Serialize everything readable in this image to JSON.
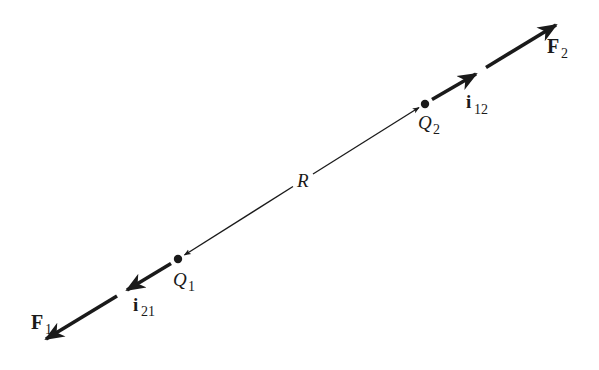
{
  "colors": {
    "ink": "#1a1a1a",
    "background": "#ffffff"
  },
  "charges": [
    {
      "id": "Q1",
      "symbol": "Q",
      "subscript": "1",
      "x": 178,
      "y": 259
    },
    {
      "id": "Q2",
      "symbol": "Q",
      "subscript": "2",
      "x": 425,
      "y": 104
    }
  ],
  "separation": {
    "label": "R"
  },
  "unit_vectors": [
    {
      "id": "i12",
      "symbol": "i",
      "subscript": "12"
    },
    {
      "id": "i21",
      "symbol": "i",
      "subscript": "21"
    }
  ],
  "forces": [
    {
      "id": "F1",
      "symbol": "F",
      "subscript": "1"
    },
    {
      "id": "F2",
      "symbol": "F",
      "subscript": "2"
    }
  ]
}
